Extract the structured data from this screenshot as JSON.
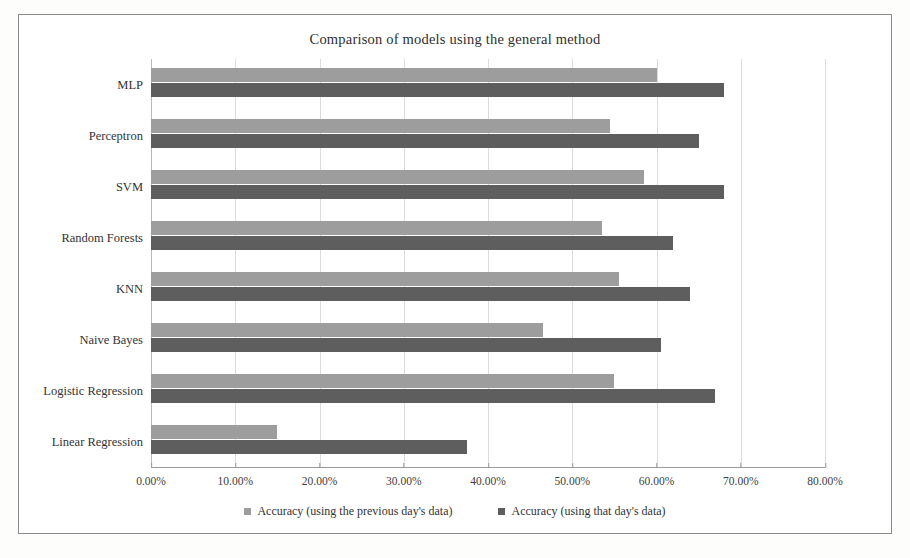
{
  "chart_data": {
    "type": "bar",
    "orientation": "horizontal",
    "title": "Comparison of models using the general method",
    "xlabel": "",
    "ylabel": "",
    "xlim": [
      0,
      80
    ],
    "x_tick_labels": [
      "0.00%",
      "10.00%",
      "20.00%",
      "30.00%",
      "40.00%",
      "50.00%",
      "60.00%",
      "70.00%",
      "80.00%"
    ],
    "x_ticks": [
      0,
      10,
      20,
      30,
      40,
      50,
      60,
      70,
      80
    ],
    "grid": true,
    "legend_position": "bottom",
    "categories": [
      "MLP",
      "Perceptron",
      "SVM",
      "Random Forests",
      "KNN",
      "Naive Bayes",
      "Logistic Regression",
      "Linear Regression"
    ],
    "series": [
      {
        "name": "Accuracy (using the previous day's data)",
        "color": "#9d9d9d",
        "values": [
          60.0,
          54.5,
          58.5,
          53.5,
          55.5,
          46.5,
          55.0,
          15.0
        ]
      },
      {
        "name": "Accuracy (using that day's data)",
        "color": "#5e5e5e",
        "values": [
          68.0,
          65.0,
          68.0,
          62.0,
          64.0,
          60.5,
          67.0,
          37.5
        ]
      }
    ]
  },
  "legend": {
    "items": [
      {
        "label": "Accuracy (using the previous day's data)"
      },
      {
        "label": "Accuracy (using that day's data)"
      }
    ]
  }
}
